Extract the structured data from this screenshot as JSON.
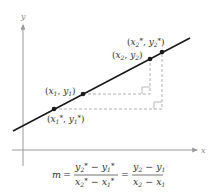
{
  "diagram": {
    "axes": {
      "x_label": "x",
      "y_label": "y"
    },
    "colors": {
      "line": "#1a1a1a",
      "axis": "#9a9a9a",
      "dashed": "#a8a8a8",
      "point": "#1a1a1a",
      "text": "#333333"
    },
    "points": [
      {
        "id": "p1star",
        "label_x": "x",
        "label_xsub": "1",
        "label_y": "y",
        "label_ysub": "1",
        "star": true
      },
      {
        "id": "p1",
        "label_x": "x",
        "label_xsub": "1",
        "label_y": "y",
        "label_ysub": "1",
        "star": false
      },
      {
        "id": "p2",
        "label_x": "x",
        "label_xsub": "2",
        "label_y": "y",
        "label_ysub": "2",
        "star": false
      },
      {
        "id": "p2star",
        "label_x": "x",
        "label_xsub": "2",
        "label_y": "y",
        "label_ysub": "2",
        "star": true
      }
    ],
    "formula": {
      "lhs": "m",
      "eq": "=",
      "frac1_num": {
        "a": "y",
        "a_sub": "2",
        "a_star": "*",
        "op": "−",
        "b": "y",
        "b_sub": "1",
        "b_star": "*"
      },
      "frac1_den": {
        "a": "x",
        "a_sub": "2",
        "a_star": "*",
        "op": "−",
        "b": "x",
        "b_sub": "1",
        "b_star": "*"
      },
      "frac2_num": {
        "a": "y",
        "a_sub": "2",
        "op": "−",
        "b": "y",
        "b_sub": "1"
      },
      "frac2_den": {
        "a": "x",
        "a_sub": "2",
        "op": "−",
        "b": "x",
        "b_sub": "1"
      }
    },
    "punct": {
      "open": "(",
      "comma": ", ",
      "close": ")",
      "star": "*"
    }
  }
}
